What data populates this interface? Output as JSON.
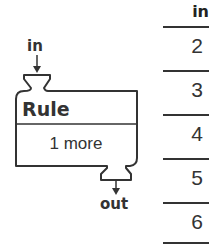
{
  "machine": {
    "input_label": "in",
    "output_label": "out",
    "title": "Rule",
    "rule": "1 more"
  },
  "table": {
    "header": "in",
    "rows": [
      "2",
      "3",
      "4",
      "5",
      "6"
    ]
  },
  "colors": {
    "stroke": "#333333",
    "text": "#333333",
    "background": "#ffffff"
  }
}
